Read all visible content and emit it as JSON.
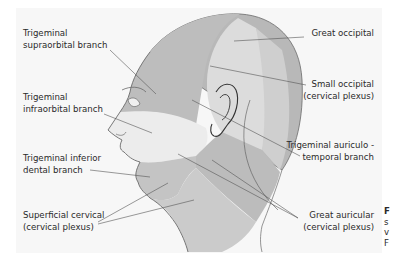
{
  "figure": {
    "colors": {
      "panel_bg": "#f7f7f7",
      "skin_light": "#e4e4e4",
      "ophthalmic_region": "#bdbdbd",
      "maxillary_region": "#ececec",
      "mandibular_region": "#c4c4c4",
      "occipital_region": "#b8b8b8",
      "small_occipital_region": "#dcdcdc",
      "auriculotemporal_region": "#cfcfcf",
      "great_auricular_region": "#bcbcbc",
      "cervical_region": "#cbcbcb",
      "outline": "#6a6a6a",
      "leader_line": "#555555",
      "text": "#2a2a2a"
    },
    "labels": {
      "supraorbital": {
        "line1": "Trigeminal",
        "line2": "supraorbital branch"
      },
      "infraorbital": {
        "line1": "Trigeminal",
        "line2": "infraorbital branch"
      },
      "inferior_dental": {
        "line1": "Trigeminal inferior",
        "line2": "dental branch"
      },
      "superficial_cervical": {
        "line1": "Superficial cervical",
        "line2": "(cervical plexus)"
      },
      "great_occipital": {
        "line1": "Great occipital"
      },
      "small_occipital": {
        "line1": "Small occipital",
        "line2": "(cervical plexus)"
      },
      "auriculotemporal": {
        "line1": "Trigeminal auriculo -",
        "line2": "temporal branch"
      },
      "great_auricular": {
        "line1": "Great auricular",
        "line2": "(cervical plexus)"
      }
    },
    "caption_clipped": {
      "line1": "F",
      "line2": "s",
      "line3": "v",
      "line4": "F"
    }
  }
}
